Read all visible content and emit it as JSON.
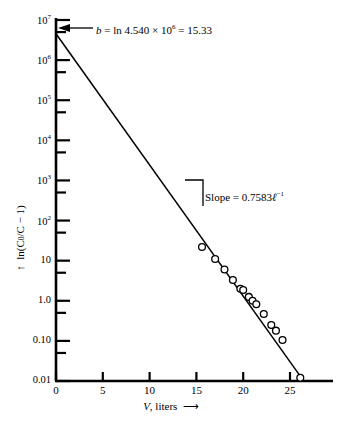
{
  "chart_data": {
    "type": "scatter",
    "title": "",
    "xlabel": "V, liters",
    "ylabel": "ln(C0/C - 1)",
    "xlim": [
      0,
      29
    ],
    "ylim_log": [
      0.01,
      10000000
    ],
    "grid": false,
    "legend": null,
    "xticks": [
      "0",
      "5",
      "10",
      "15",
      "20",
      "25"
    ],
    "xtick_values": [
      0,
      5,
      10,
      15,
      20,
      25
    ],
    "ytick_labels": [
      "10^7",
      "10^6",
      "10^5",
      "10^4",
      "10^3",
      "10^2",
      "10",
      "1.0",
      "0.10",
      "0.01"
    ],
    "ytick_values": [
      10000000,
      1000000,
      100000,
      10000,
      1000,
      100,
      10,
      1.0,
      0.1,
      0.01
    ],
    "y_minor_ticks_per_decade": 1,
    "series": [
      {
        "name": "data",
        "marker": "open-circle",
        "x": [
          15.6,
          17.0,
          18.0,
          18.9,
          19.7,
          20.0,
          20.6,
          21.0,
          21.4,
          22.2,
          23.0,
          23.5,
          24.2,
          26.1
        ],
        "y": [
          22.0,
          11.0,
          6.0,
          3.3,
          2.0,
          1.85,
          1.25,
          1.0,
          0.82,
          0.47,
          0.25,
          0.18,
          0.105,
          0.012
        ]
      }
    ],
    "fit_line": {
      "type": "line",
      "x_start": 0.0,
      "y_start": 4540000,
      "x_end": 26.4,
      "y_end": 0.0105,
      "intercept_b": 15.33,
      "slope": -0.7583
    },
    "annotations": {
      "intercept": {
        "text_prefix": "b",
        "text_body": " = ln 4.540 × 10",
        "exponent": "6",
        "text_suffix": " = 15.33",
        "target_x": 0,
        "target_y": 4540000
      },
      "slope": {
        "label": "Slope",
        "equals": " = ",
        "value": "0.7583",
        "unit_symbol": "ℓ",
        "unit_exponent": "−1"
      }
    },
    "axis_arrows": {
      "y_axis": "up-arrow",
      "x_axis": "right-arrow"
    }
  },
  "axis": {
    "y_label_main": "ln(C",
    "y_label_sub": "0",
    "y_label_rest": "/C − 1)",
    "x_label_italic": "V",
    "x_label_rest": ", liters"
  }
}
